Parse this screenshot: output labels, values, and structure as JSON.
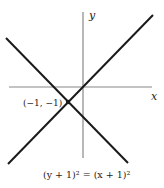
{
  "axes": {
    "x_label": "x",
    "y_label": "y"
  },
  "point": {
    "label": "(−1, −1)",
    "x": -1,
    "y": -1
  },
  "caption": "(y + 1)² = (x + 1)²",
  "lines": [
    {
      "name": "y = x",
      "color": "#1a1a1a"
    },
    {
      "name": "y = -x - 2",
      "color": "#1a1a1a"
    }
  ],
  "colors": {
    "axis": "#888888",
    "line": "#1a1a1a",
    "background": "#ffffff"
  }
}
